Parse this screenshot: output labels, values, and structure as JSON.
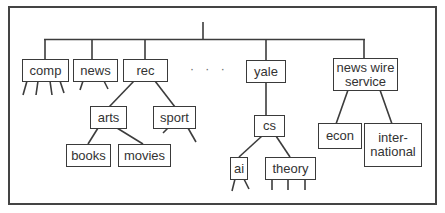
{
  "diagram": {
    "type": "hierarchy-tree",
    "ellipsis": "· · ·",
    "nodes": {
      "comp": "comp",
      "news": "news",
      "rec": "rec",
      "yale": "yale",
      "news_wire_service": "news wire\nservice",
      "arts": "arts",
      "sport": "sport",
      "books": "books",
      "movies": "movies",
      "cs": "cs",
      "ai": "ai",
      "theory": "theory",
      "econ": "econ",
      "international": "inter-\nnational"
    },
    "edges": [
      [
        "root",
        "comp"
      ],
      [
        "root",
        "news"
      ],
      [
        "root",
        "rec"
      ],
      [
        "root",
        "yale"
      ],
      [
        "root",
        "news_wire_service"
      ],
      [
        "rec",
        "arts"
      ],
      [
        "rec",
        "sport"
      ],
      [
        "arts",
        "books"
      ],
      [
        "arts",
        "movies"
      ],
      [
        "yale",
        "cs"
      ],
      [
        "cs",
        "ai"
      ],
      [
        "cs",
        "theory"
      ],
      [
        "news_wire_service",
        "econ"
      ],
      [
        "news_wire_service",
        "international"
      ]
    ],
    "colors": {
      "line": "#3c3c3c",
      "text": "#333333",
      "background": "#ffffff"
    }
  }
}
